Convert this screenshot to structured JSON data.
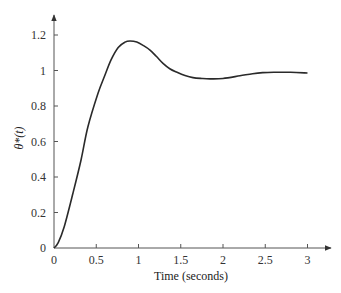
{
  "chart_data": {
    "type": "line",
    "title": "",
    "xlabel": "Time (seconds)",
    "ylabel": "θ*(t)",
    "xlim": [
      0,
      3
    ],
    "ylim": [
      0,
      1.2
    ],
    "xticks": [
      0,
      0.5,
      1,
      1.5,
      2,
      2.5,
      3
    ],
    "xtick_labels": [
      "0",
      "0.5",
      "1",
      "1.5",
      "2",
      "2.5",
      "3"
    ],
    "yticks": [
      0,
      0.2,
      0.4,
      0.6,
      0.8,
      1,
      1.2
    ],
    "ytick_labels": [
      "0",
      "0.2",
      "0.4",
      "0.6",
      "0.8",
      "1",
      "1.2"
    ],
    "grid": false,
    "legend": "none",
    "series": [
      {
        "name": "θ*(t)",
        "x": [
          0,
          0.05,
          0.12,
          0.225,
          0.32,
          0.4,
          0.52,
          0.6,
          0.675,
          0.76,
          0.84,
          0.9,
          0.98,
          1.06,
          1.136,
          1.21,
          1.29,
          1.37,
          1.456,
          1.55,
          1.645,
          1.75,
          1.846,
          2.0,
          2.2,
          2.35,
          2.47,
          2.6,
          2.8,
          3.0
        ],
        "y": [
          0,
          0.03,
          0.118,
          0.31,
          0.496,
          0.68,
          0.87,
          0.97,
          1.06,
          1.13,
          1.16,
          1.166,
          1.16,
          1.14,
          1.115,
          1.08,
          1.04,
          1.01,
          0.99,
          0.972,
          0.96,
          0.955,
          0.953,
          0.955,
          0.97,
          0.982,
          0.988,
          0.99,
          0.99,
          0.986
        ]
      }
    ]
  }
}
